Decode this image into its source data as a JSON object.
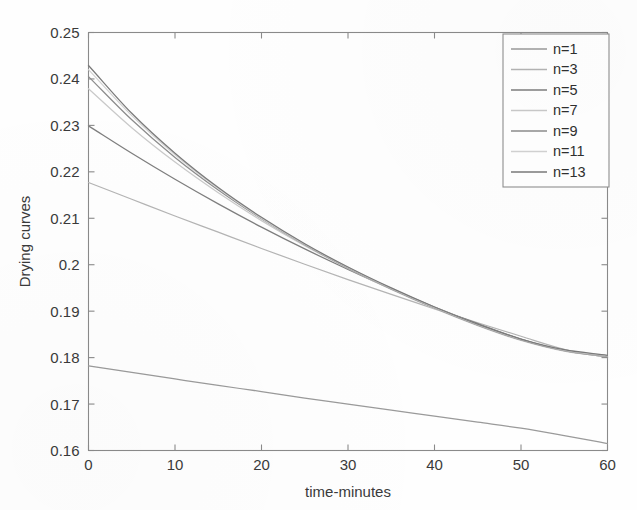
{
  "figure": {
    "background_color": "#fefefe",
    "axis_color": "#8a8a8a",
    "text_color": "#3a3a3a"
  },
  "axes": {
    "x_title": "time-minutes",
    "y_title": "Drying curves",
    "x_ticks": [
      "0",
      "10",
      "20",
      "30",
      "40",
      "50",
      "60"
    ],
    "y_ticks": [
      "0.16",
      "0.17",
      "0.18",
      "0.19",
      "0.2",
      "0.21",
      "0.22",
      "0.23",
      "0.24",
      "0.25"
    ]
  },
  "legend": {
    "position": "top-right",
    "entries": [
      {
        "label": "n=1",
        "color": "#9a9a9a"
      },
      {
        "label": "n=3",
        "color": "#b4b4b4"
      },
      {
        "label": "n=5",
        "color": "#7e7e7e"
      },
      {
        "label": "n=7",
        "color": "#c9c9c9"
      },
      {
        "label": "n=9",
        "color": "#8c8c8c"
      },
      {
        "label": "n=11",
        "color": "#d2d2d2"
      },
      {
        "label": "n=13",
        "color": "#7a7a7a"
      }
    ]
  },
  "chart_data": {
    "type": "line",
    "title": "",
    "xlabel": "time-minutes",
    "ylabel": "Drying curves",
    "xlim": [
      0,
      60
    ],
    "ylim": [
      0.16,
      0.25
    ],
    "xticks": [
      0,
      10,
      20,
      30,
      40,
      50,
      60
    ],
    "yticks": [
      0.16,
      0.17,
      0.18,
      0.19,
      0.2,
      0.21,
      0.22,
      0.23,
      0.24,
      0.25
    ],
    "grid": false,
    "legend_position": "upper right",
    "x": [
      0,
      5,
      10,
      15,
      20,
      25,
      30,
      35,
      40,
      45,
      50,
      55,
      60
    ],
    "series": [
      {
        "name": "n=1",
        "color": "#9a9a9a",
        "values": [
          0.1782,
          0.1768,
          0.1754,
          0.174,
          0.1727,
          0.1713,
          0.17,
          0.1687,
          0.1674,
          0.1661,
          0.1648,
          0.1632,
          0.1615
        ]
      },
      {
        "name": "n=3",
        "color": "#b4b4b4",
        "values": [
          0.2177,
          0.2141,
          0.2105,
          0.207,
          0.2035,
          0.2001,
          0.1968,
          0.1936,
          0.1905,
          0.1875,
          0.1846,
          0.1818,
          0.18
        ]
      },
      {
        "name": "n=5",
        "color": "#7e7e7e",
        "values": [
          0.2299,
          0.224,
          0.2184,
          0.2131,
          0.2081,
          0.2034,
          0.199,
          0.1948,
          0.1909,
          0.1873,
          0.184,
          0.1815,
          0.1801
        ]
      },
      {
        "name": "n=7",
        "color": "#c9c9c9",
        "values": [
          0.2379,
          0.2295,
          0.2221,
          0.2155,
          0.2095,
          0.2041,
          0.1992,
          0.1947,
          0.1906,
          0.1869,
          0.1837,
          0.1814,
          0.1802
        ]
      },
      {
        "name": "n=9",
        "color": "#8c8c8c",
        "values": [
          0.2405,
          0.2312,
          0.2231,
          0.2161,
          0.2099,
          0.2043,
          0.1993,
          0.1948,
          0.1907,
          0.187,
          0.1838,
          0.1815,
          0.1803
        ]
      },
      {
        "name": "n=11",
        "color": "#d2d2d2",
        "values": [
          0.242,
          0.2321,
          0.2237,
          0.2164,
          0.21,
          0.2044,
          0.1994,
          0.1949,
          0.1908,
          0.1871,
          0.1839,
          0.1816,
          0.1804
        ]
      },
      {
        "name": "n=13",
        "color": "#7a7a7a",
        "values": [
          0.2429,
          0.2326,
          0.224,
          0.2166,
          0.2102,
          0.2045,
          0.1995,
          0.195,
          0.1909,
          0.1872,
          0.184,
          0.1817,
          0.1805
        ]
      }
    ]
  }
}
